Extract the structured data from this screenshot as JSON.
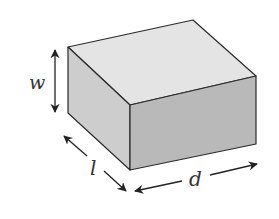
{
  "figure": {
    "type": "rectangular-box",
    "labels": {
      "w": "w",
      "l": "l",
      "d": "d"
    },
    "colors": {
      "top_face": "#e4e4e4",
      "left_face": "#cdcdcd",
      "front_face": "#b9b9b9",
      "edge": "#2a2a2a",
      "arrow": "#222222",
      "label": "#333333"
    }
  }
}
